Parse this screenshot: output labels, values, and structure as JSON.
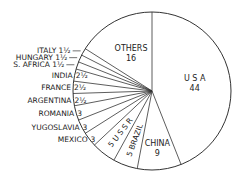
{
  "chart_data": {
    "type": "pie",
    "title": "",
    "start": "12 o'clock, clockwise",
    "slices": [
      {
        "label": "U S A",
        "value": 44,
        "value_label": "44"
      },
      {
        "label": "CHINA",
        "value": 9,
        "value_label": "9"
      },
      {
        "label": "BRAZIL",
        "value": 5,
        "value_label": "5"
      },
      {
        "label": "U S S R",
        "value": 5,
        "value_label": "5"
      },
      {
        "label": "MEXICO",
        "value": 3,
        "value_label": "3"
      },
      {
        "label": "YUGOSLAVIA",
        "value": 3,
        "value_label": "3"
      },
      {
        "label": "ROMANIA",
        "value": 3,
        "value_label": "3"
      },
      {
        "label": "ARGENTINA",
        "value": 2.5,
        "value_label": "2½"
      },
      {
        "label": "FRANCE",
        "value": 2.5,
        "value_label": "2½"
      },
      {
        "label": "INDIA",
        "value": 2.5,
        "value_label": "2½"
      },
      {
        "label": "S. AFRICA",
        "value": 1.5,
        "value_label": "1½"
      },
      {
        "label": "HUNGARY",
        "value": 1.5,
        "value_label": "1½"
      },
      {
        "label": "ITALY",
        "value": 1.5,
        "value_label": "1½"
      },
      {
        "label": "OTHERS",
        "value": 16,
        "value_label": "16"
      }
    ],
    "colors": {
      "stroke": "#333333",
      "fill": "#ffffff",
      "text": "#222222"
    }
  },
  "geometry": {
    "cx": 152,
    "cy": 91,
    "r": 79
  }
}
